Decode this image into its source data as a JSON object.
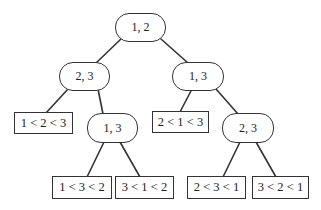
{
  "diagram": {
    "type": "decision-tree",
    "nodes": [
      {
        "id": "root",
        "label": "1, 2",
        "kind": "comparison"
      },
      {
        "id": "l",
        "label": "2, 3",
        "kind": "comparison"
      },
      {
        "id": "r",
        "label": "1, 3",
        "kind": "comparison"
      },
      {
        "id": "ll",
        "label": "1 < 2 < 3",
        "kind": "leaf"
      },
      {
        "id": "lr",
        "label": "1, 3",
        "kind": "comparison"
      },
      {
        "id": "rl",
        "label": "2 < 1 < 3",
        "kind": "leaf"
      },
      {
        "id": "rr",
        "label": "2, 3",
        "kind": "comparison"
      },
      {
        "id": "lrl",
        "label": "1 < 3 < 2",
        "kind": "leaf"
      },
      {
        "id": "lrr",
        "label": "3 < 1 < 2",
        "kind": "leaf"
      },
      {
        "id": "rrl",
        "label": "2 < 3 < 1",
        "kind": "leaf"
      },
      {
        "id": "rrr",
        "label": "3 < 2 < 1",
        "kind": "leaf"
      }
    ],
    "edges": [
      [
        "root",
        "l"
      ],
      [
        "root",
        "r"
      ],
      [
        "l",
        "ll"
      ],
      [
        "l",
        "lr"
      ],
      [
        "r",
        "rl"
      ],
      [
        "r",
        "rr"
      ],
      [
        "lr",
        "lrl"
      ],
      [
        "lr",
        "lrr"
      ],
      [
        "rr",
        "rrl"
      ],
      [
        "rr",
        "rrr"
      ]
    ],
    "colors": {
      "line": "#333333",
      "background": "#ffffff",
      "text": "#222222"
    }
  }
}
